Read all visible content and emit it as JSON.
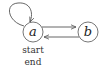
{
  "diagram": {
    "type": "state-machine",
    "nodes": [
      {
        "id": "a",
        "label": "a",
        "sublabels": [
          "start",
          "end"
        ]
      },
      {
        "id": "b",
        "label": "b"
      }
    ],
    "edges": [
      {
        "from": "a",
        "to": "a",
        "kind": "self-loop"
      },
      {
        "from": "a",
        "to": "b"
      },
      {
        "from": "b",
        "to": "a"
      }
    ]
  },
  "labels": {
    "node_a": "a",
    "node_b": "b",
    "start": "start",
    "end": "end"
  },
  "colors": {
    "stroke": "#555555",
    "text": "#222222",
    "background": "#ffffff"
  }
}
